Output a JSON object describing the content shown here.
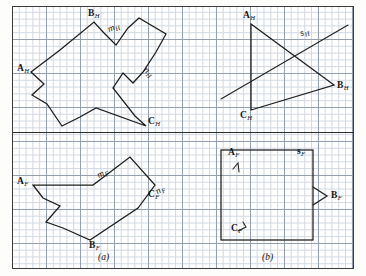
{
  "figure": {
    "kind": "descriptive-geometry-plate",
    "background": "graph-paper",
    "ink_color": "#1c1c1c",
    "grid_color": "#c9d2dd",
    "grid_major_color": "#8e9aa8",
    "captions": [
      {
        "id": "caption-a",
        "text": "(a)"
      },
      {
        "id": "caption-b",
        "text": "(b)"
      }
    ]
  },
  "panels": {
    "top_left": {
      "name": "horizontal-projection-irregular-polygon",
      "labels": [
        {
          "id": "label-a-h",
          "letter": "A",
          "sub": "H"
        },
        {
          "id": "label-b-h",
          "letter": "B",
          "sub": "H"
        },
        {
          "id": "label-c-h",
          "letter": "C",
          "sub": "H"
        },
        {
          "id": "label-m-h",
          "letter": "m",
          "sub": "H"
        },
        {
          "id": "label-n-h",
          "letter": "n",
          "sub": "H"
        }
      ],
      "polygon_points": "31,72 60,50 94,22 104,33 116,45 128,28 139,18 166,34 156,52 143,72 133,83 123,73 113,88 135,116 146,126 96,108 80,117 62,126 47,104 32,95 44,84"
    },
    "bottom_left": {
      "name": "frontal-projection-irregular-polygon",
      "labels": [
        {
          "id": "label-a-f",
          "letter": "A",
          "sub": "F"
        },
        {
          "id": "label-b-f",
          "letter": "B",
          "sub": "F"
        },
        {
          "id": "label-c-f",
          "letter": "C",
          "sub": "F"
        },
        {
          "id": "label-m-f",
          "letter": "m",
          "sub": "F"
        },
        {
          "id": "label-n-f",
          "letter": "n",
          "sub": "F"
        }
      ],
      "polygon_points": "33,185 93,185 130,157 155,185 138,208 90,240 63,228 46,222 60,206 43,198"
    },
    "top_right": {
      "name": "horizontal-projection-triangle-with-line-s",
      "labels": [
        {
          "id": "label-a-h2",
          "letter": "A",
          "sub": "H"
        },
        {
          "id": "label-b-h2",
          "letter": "B",
          "sub": "H"
        },
        {
          "id": "label-c-h2",
          "letter": "C",
          "sub": "H"
        },
        {
          "id": "label-s-h",
          "letter": "s",
          "sub": "H"
        }
      ],
      "triangle_points": "251,24 334,85 251,110",
      "line_s": "221,99 348,25"
    },
    "bottom_right": {
      "name": "frontal-projection-rectangle-with-line-s",
      "labels": [
        {
          "id": "label-a-f2",
          "letter": "A",
          "sub": "F"
        },
        {
          "id": "label-b-f2",
          "letter": "B",
          "sub": "F"
        },
        {
          "id": "label-c-f2",
          "letter": "C",
          "sub": "F"
        },
        {
          "id": "label-s-f",
          "letter": "s",
          "sub": "F"
        }
      ],
      "rect": {
        "x": 221,
        "y": 150,
        "w": 92,
        "h": 90
      },
      "b_arrow": "313,187 327,196 313,205",
      "a_tick": "237,164 239,172",
      "c_tick": "242,224 238,231"
    }
  }
}
